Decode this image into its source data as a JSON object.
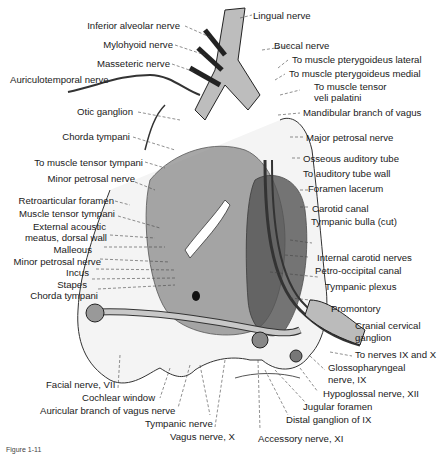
{
  "figure": {
    "caption": "Figure 1-11",
    "labels_left": [
      {
        "id": "inferior-alveolar-nerve",
        "text": "Inferior alveolar nerve"
      },
      {
        "id": "mylohyoid-nerve",
        "text": "Mylohyoid nerve"
      },
      {
        "id": "masseteric-nerve",
        "text": "Masseteric nerve"
      },
      {
        "id": "auriculotemporal-nerve",
        "text": "Auriculotemporal nerve"
      },
      {
        "id": "otic-ganglion",
        "text": "Otic ganglion"
      },
      {
        "id": "chorda-tympani-upper",
        "text": "Chorda tympani"
      },
      {
        "id": "to-muscle-tensor-tympani",
        "text": "To muscle tensor tympani"
      },
      {
        "id": "minor-petrosal-nerve-upper",
        "text": "Minor petrosal nerve"
      },
      {
        "id": "retroarticular-foramen",
        "text": "Retroarticular foramen"
      },
      {
        "id": "muscle-tensor-tympani",
        "text": "Muscle tensor tympani"
      },
      {
        "id": "external-acoustic-meatus-1",
        "text": "External acoustic"
      },
      {
        "id": "external-acoustic-meatus-2",
        "text": "meatus, dorsal wall"
      },
      {
        "id": "malleous",
        "text": "Malleous"
      },
      {
        "id": "minor-petrosal-nerve-lower",
        "text": "Minor petrosal nerve"
      },
      {
        "id": "incus",
        "text": "Incus"
      },
      {
        "id": "stapes",
        "text": "Stapes"
      },
      {
        "id": "chorda-tympani-lower",
        "text": "Chorda tympani"
      }
    ],
    "labels_right": [
      {
        "id": "lingual-nerve",
        "text": "Lingual nerve"
      },
      {
        "id": "buccal-nerve",
        "text": "Buccal nerve"
      },
      {
        "id": "to-muscle-pterygoideus-lateral",
        "text": "To muscle pterygoideus lateral"
      },
      {
        "id": "to-muscle-pterygoideus-medial",
        "text": "To muscle pterygoideus medial"
      },
      {
        "id": "to-muscle-tensor-veli-1",
        "text": "To muscle tensor"
      },
      {
        "id": "to-muscle-tensor-veli-2",
        "text": "veli palatini"
      },
      {
        "id": "mandibular-branch-of-vagus",
        "text": "Mandibular branch of vagus"
      },
      {
        "id": "major-petrosal-nerve",
        "text": "Major petrosal nerve"
      },
      {
        "id": "osseous-auditory-tube",
        "text": "Osseous auditory tube"
      },
      {
        "id": "to-auditory-tube-wall",
        "text": "To auditory tube wall"
      },
      {
        "id": "foramen-lacerum",
        "text": "Foramen lacerum"
      },
      {
        "id": "carotid-canal",
        "text": "Carotid canal"
      },
      {
        "id": "tympanic-bulla-cut",
        "text": "Tympanic bulla (cut)"
      },
      {
        "id": "internal-carotid-nerves",
        "text": "Internal carotid nerves"
      },
      {
        "id": "petro-occipital-canal",
        "text": "Petro-occipital canal"
      },
      {
        "id": "tympanic-plexus",
        "text": "Tympanic plexus"
      },
      {
        "id": "promontory",
        "text": "Promontory"
      },
      {
        "id": "cranial-cervical-ganglion-1",
        "text": "Cranial cervical"
      },
      {
        "id": "cranial-cervical-ganglion-2",
        "text": "ganglion"
      },
      {
        "id": "to-nerves-ix-and-x",
        "text": "To nerves IX and X"
      },
      {
        "id": "glossopharyngeal-nerve-1",
        "text": "Glossopharyngeal"
      },
      {
        "id": "glossopharyngeal-nerve-2",
        "text": "nerve, IX"
      },
      {
        "id": "hypoglossal-nerve",
        "text": "Hypoglossal nerve, XII"
      }
    ],
    "labels_bottom": [
      {
        "id": "facial-nerve",
        "text": "Facial nerve, VII"
      },
      {
        "id": "cochlear-window",
        "text": "Cochlear window"
      },
      {
        "id": "auricular-branch-of-vagus",
        "text": "Auricular branch of vagus nerve"
      },
      {
        "id": "tympanic-nerve",
        "text": "Tympanic nerve"
      },
      {
        "id": "vagus-nerve",
        "text": "Vagus nerve, X"
      },
      {
        "id": "accessory-nerve",
        "text": "Accessory nerve, XI"
      },
      {
        "id": "distal-ganglion-of-ix",
        "text": "Distal ganglion of IX"
      },
      {
        "id": "jugular-foramen",
        "text": "Jugular foramen"
      }
    ]
  }
}
